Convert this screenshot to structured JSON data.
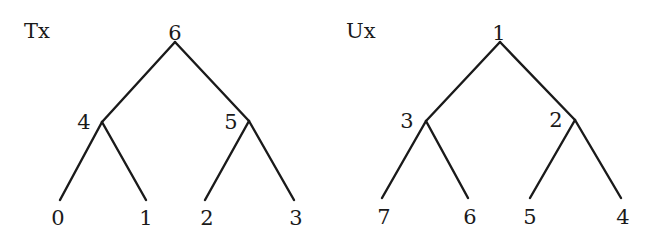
{
  "trees": [
    {
      "name": "Tx",
      "nodes": {
        "root": {
          "label": "6"
        },
        "left": {
          "label": "4"
        },
        "right": {
          "label": "5"
        },
        "leaves": [
          {
            "label": "0"
          },
          {
            "label": "1"
          },
          {
            "label": "2"
          },
          {
            "label": "3"
          }
        ]
      }
    },
    {
      "name": "Ux",
      "nodes": {
        "root": {
          "label": "1"
        },
        "left": {
          "label": "3"
        },
        "right": {
          "label": "2"
        },
        "leaves": [
          {
            "label": "7"
          },
          {
            "label": "6"
          },
          {
            "label": "5"
          },
          {
            "label": "4"
          }
        ]
      }
    }
  ]
}
